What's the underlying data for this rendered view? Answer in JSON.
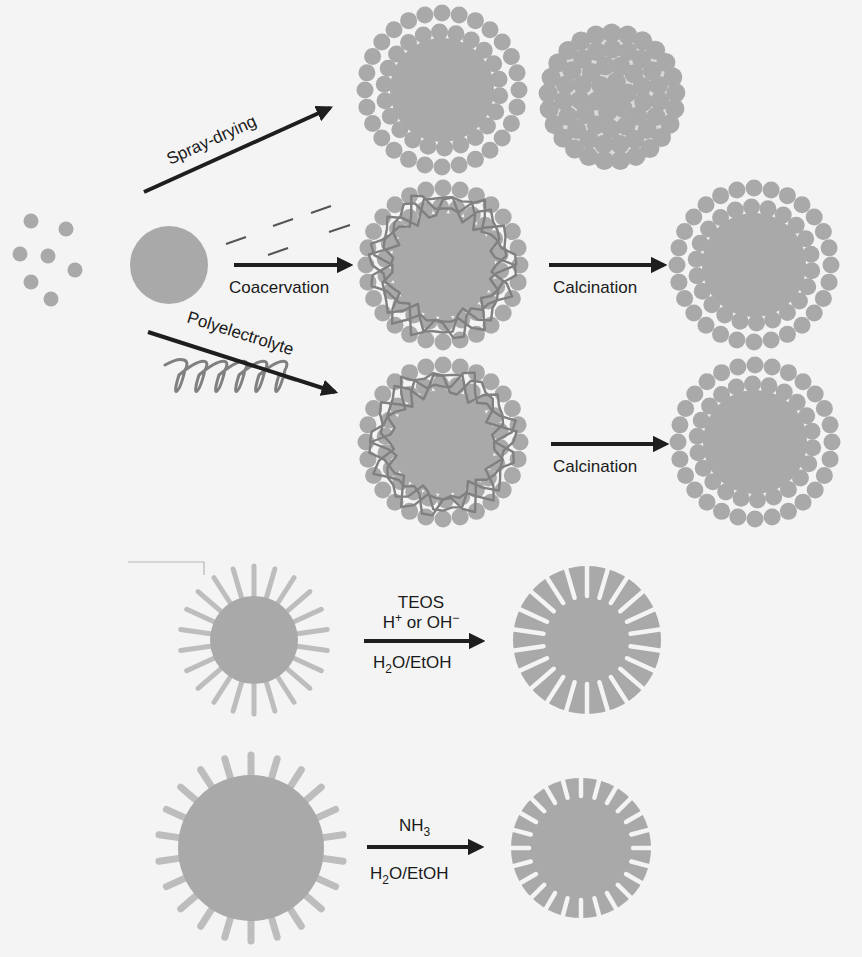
{
  "figure": {
    "colors": {
      "background": "#f4f4f4",
      "particle": "#a9a9a9",
      "polymer": "#808080",
      "arrow": "#1e1e1e",
      "text": "#1a1a1a",
      "pore": "#f4f4f4"
    },
    "top_section": {
      "starting_materials": {
        "small_particles": "nanoparticles",
        "large_particle": "template-sphere",
        "short_lines": "polymer-fragments",
        "coil": "polyelectrolyte-chain"
      },
      "routes": [
        {
          "id": "spray-drying",
          "label": "Spray-drying",
          "products": [
            "core-shell-particle",
            "aggregated-nanoparticle-cluster"
          ]
        },
        {
          "id": "coacervation",
          "label": "Coacervation",
          "intermediate": "polymer-wrapped-core-shell",
          "step_label": "Calcination",
          "product": "core-shell-particle"
        },
        {
          "id": "polyelectrolyte",
          "label": "Polyelectrolyte",
          "intermediate": "polymer-wrapped-core-shell",
          "step_label": "Calcination",
          "product": "core-shell-particle"
        }
      ]
    },
    "bottom_section": {
      "reactions": [
        {
          "id": "acid-base",
          "reagents_above": [
            "TEOS",
            "H+ or OH−"
          ],
          "reagents_above_parts": [
            {
              "main": "TEOS"
            },
            {
              "main": "H",
              "sup": "+",
              "rest": " or OH",
              "sup2": "−"
            }
          ],
          "reagents_below": {
            "a": "H",
            "sub": "2",
            "b": "O/EtOH"
          },
          "reactant": "surfactant-coated-sphere",
          "product": "mesoporous-silica-sphere"
        },
        {
          "id": "ammonia",
          "reagents_above": {
            "main": "NH",
            "sub": "3"
          },
          "reagents_below": {
            "a": "H",
            "sub": "2",
            "b": "O/EtOH"
          },
          "reactant": "surfactant-coated-large-sphere",
          "product": "mesoporous-silica-sphere"
        }
      ]
    }
  }
}
